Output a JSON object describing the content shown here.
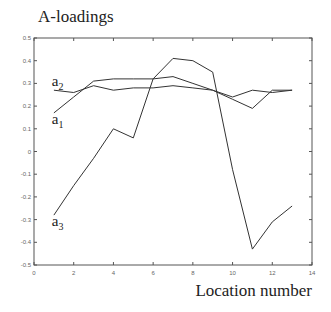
{
  "chart_data": {
    "type": "line",
    "title": "A-loadings",
    "xlabel": "Location number",
    "ylabel": "",
    "xlim": [
      0,
      14
    ],
    "ylim": [
      -0.5,
      0.5
    ],
    "xticks": [
      0,
      2,
      4,
      6,
      8,
      10,
      12,
      14
    ],
    "xtick_labels": [
      "0",
      "2",
      "4",
      "6",
      "8",
      "10",
      "12",
      "14"
    ],
    "yticks": [
      0.5,
      0.4,
      0.3,
      0.2,
      0.1,
      0,
      -0.1,
      -0.2,
      -0.3,
      -0.4,
      -0.5
    ],
    "ytick_labels": [
      "0.5",
      "0.4",
      "0.3",
      "0.2",
      "0.1",
      "0",
      "-0.1",
      "-0.2",
      "-0.3",
      "-0.4",
      "-0.5"
    ],
    "grid": false,
    "legend": "none (inline annotations)",
    "x": [
      1,
      2,
      3,
      4,
      5,
      6,
      7,
      8,
      9,
      10,
      11,
      12,
      13
    ],
    "series": [
      {
        "name": "a1",
        "label_main": "a",
        "label_sub": "1",
        "values": [
          0.17,
          0.24,
          0.31,
          0.32,
          0.32,
          0.32,
          0.33,
          0.3,
          0.27,
          0.23,
          0.19,
          0.27,
          0.27
        ],
        "label_at": [
          1.0,
          0.12
        ]
      },
      {
        "name": "a2",
        "label_main": "a",
        "label_sub": "2",
        "values": [
          0.27,
          0.26,
          0.29,
          0.27,
          0.28,
          0.28,
          0.29,
          0.28,
          0.27,
          0.24,
          0.27,
          0.26,
          0.27
        ],
        "label_at": [
          1.0,
          0.29
        ]
      },
      {
        "name": "a3",
        "label_main": "a",
        "label_sub": "3",
        "values": [
          -0.28,
          -0.15,
          -0.03,
          0.1,
          0.06,
          0.32,
          0.41,
          0.4,
          0.35,
          -0.08,
          -0.43,
          -0.31,
          -0.24
        ],
        "label_at": [
          1.0,
          -0.33
        ]
      }
    ],
    "line_color": "#333333",
    "axis_color": "#555555"
  },
  "caption": ""
}
